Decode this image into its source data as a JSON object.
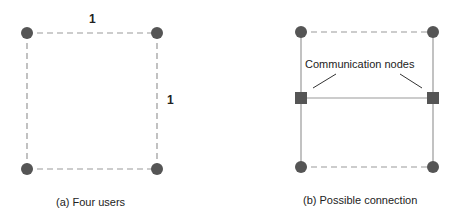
{
  "panel_a": {
    "caption": "(a) Four users",
    "edge_top_label": "1",
    "edge_right_label": "1"
  },
  "panel_b": {
    "caption": "(b) Possible connection",
    "annotation": "Communication nodes"
  },
  "colors": {
    "node": "#555555",
    "line": "#999999",
    "text": "#222222"
  }
}
